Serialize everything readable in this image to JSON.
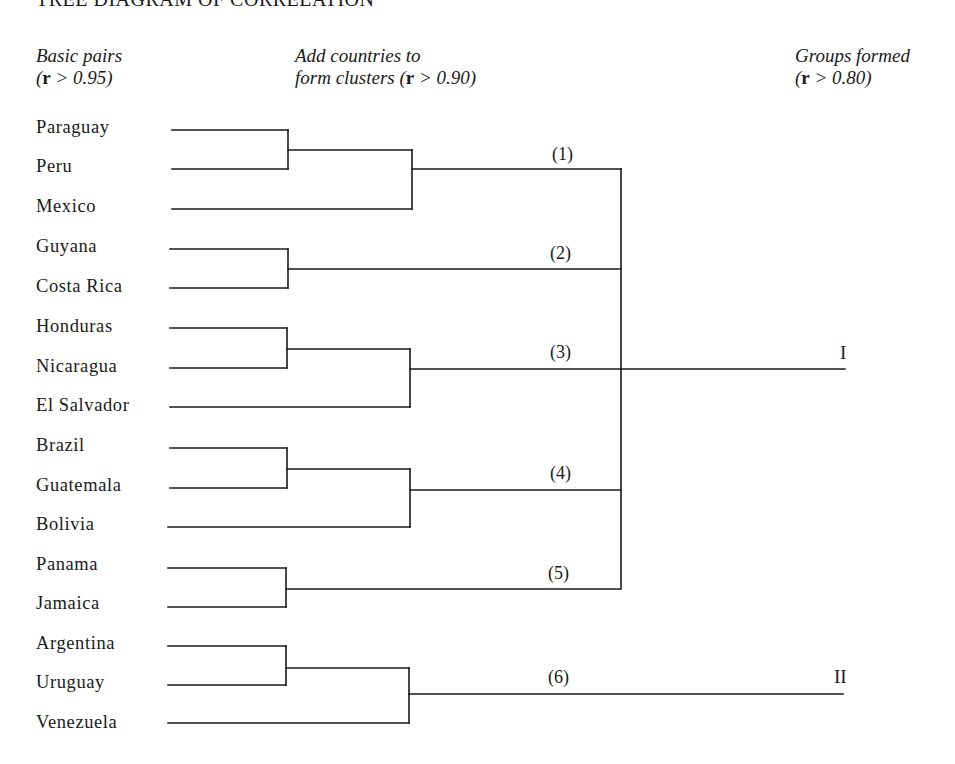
{
  "title": "TREE DIAGRAM OF CORRELATION",
  "columns": {
    "basic_pairs": {
      "line1": "Basic pairs",
      "line2_prefix": "(",
      "r": "r",
      "line2_suffix": " > 0.95)"
    },
    "clusters": {
      "line1": "Add countries to",
      "line2_prefix": "form clusters (",
      "r": "r",
      "line2_suffix": " > 0.90)"
    },
    "groups": {
      "line1": "Groups formed",
      "line2_prefix": "(",
      "r": "r",
      "line2_suffix": " > 0.80)"
    }
  },
  "countries": [
    {
      "name": "Paraguay",
      "y": 129
    },
    {
      "name": "Peru",
      "y": 168
    },
    {
      "name": "Mexico",
      "y": 208
    },
    {
      "name": "Guyana",
      "y": 248
    },
    {
      "name": "Costa Rica",
      "y": 288
    },
    {
      "name": "Honduras",
      "y": 328
    },
    {
      "name": "Nicaragua",
      "y": 368
    },
    {
      "name": "El Salvador",
      "y": 407
    },
    {
      "name": "Brazil",
      "y": 447
    },
    {
      "name": "Guatemala",
      "y": 487
    },
    {
      "name": "Bolivia",
      "y": 526
    },
    {
      "name": "Panama",
      "y": 566
    },
    {
      "name": "Jamaica",
      "y": 605
    },
    {
      "name": "Argentina",
      "y": 645
    },
    {
      "name": "Uruguay",
      "y": 684
    },
    {
      "name": "Venezuela",
      "y": 724
    }
  ],
  "clusters": [
    {
      "label": "(1)",
      "members": [
        "Paraguay",
        "Peru",
        "Mexico"
      ],
      "group": "I"
    },
    {
      "label": "(2)",
      "members": [
        "Guyana",
        "Costa Rica"
      ],
      "group": "I"
    },
    {
      "label": "(3)",
      "members": [
        "Honduras",
        "Nicaragua",
        "El Salvador"
      ],
      "group": "I"
    },
    {
      "label": "(4)",
      "members": [
        "Brazil",
        "Guatemala",
        "Bolivia"
      ],
      "group": "I"
    },
    {
      "label": "(5)",
      "members": [
        "Panama",
        "Jamaica"
      ],
      "group": "I"
    },
    {
      "label": "(6)",
      "members": [
        "Argentina",
        "Uruguay",
        "Venezuela"
      ],
      "group": "II"
    }
  ],
  "groups": [
    {
      "label": "I",
      "clusters": [
        "(1)",
        "(2)",
        "(3)",
        "(4)",
        "(5)"
      ]
    },
    {
      "label": "II",
      "clusters": [
        "(6)"
      ]
    }
  ],
  "thresholds": {
    "pairs": 0.95,
    "clusters": 0.9,
    "groups": 0.8
  }
}
